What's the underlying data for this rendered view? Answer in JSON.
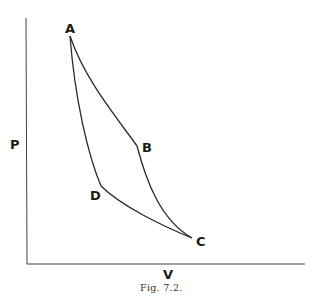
{
  "figure": {
    "caption": "Fig. 7.2.",
    "axes": {
      "x_label": "V",
      "y_label": "P"
    },
    "points": [
      {
        "id": "A",
        "label": "A"
      },
      {
        "id": "B",
        "label": "B"
      },
      {
        "id": "C",
        "label": "C"
      },
      {
        "id": "D",
        "label": "D"
      }
    ],
    "curves": [
      {
        "from": "A",
        "to": "B"
      },
      {
        "from": "B",
        "to": "C"
      },
      {
        "from": "C",
        "to": "D"
      },
      {
        "from": "D",
        "to": "A"
      }
    ],
    "colors": {
      "line": "#2a2a2a",
      "background": "#ffffff"
    }
  }
}
